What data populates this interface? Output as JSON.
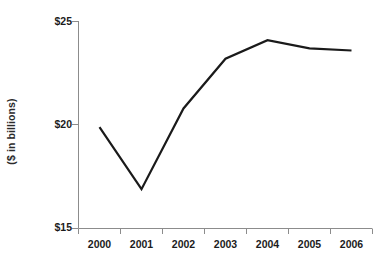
{
  "chart_data": {
    "type": "line",
    "title": "",
    "subtitle": "",
    "xlabel": "",
    "ylabel": "($ in billions)",
    "categories": [
      "2000",
      "2001",
      "2002",
      "2003",
      "2004",
      "2005",
      "2006"
    ],
    "values": [
      19.9,
      16.9,
      20.8,
      23.2,
      24.1,
      23.7,
      23.6
    ],
    "series": [
      {
        "name": "",
        "values": [
          19.9,
          16.9,
          20.8,
          23.2,
          24.1,
          23.7,
          23.6
        ]
      }
    ],
    "ylim": [
      15,
      25
    ],
    "ytick_values": [
      15,
      20,
      25
    ],
    "ytick_labels": [
      "$15",
      "$20",
      "$25"
    ],
    "xtick_labels": [
      "2000",
      "2001",
      "2002",
      "2003",
      "2004",
      "2005",
      "2006"
    ],
    "grid": false,
    "legend": false,
    "legend_position": "none",
    "line_color": "#1a1a1a",
    "axis_color": "#8c8c8c",
    "text_color": "#1c1c1c",
    "background_color": "#ffffff"
  },
  "axes": {
    "y_title": "($ in billions)"
  }
}
